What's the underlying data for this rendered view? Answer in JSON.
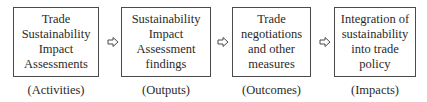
{
  "diagram": {
    "type": "flow",
    "direction": "left-to-right",
    "stages": [
      {
        "text": "Trade\nSustainability\nImpact\nAssessments",
        "label": "(Activities)"
      },
      {
        "text": "Sustainability\nImpact\nAssessment\nfindings",
        "label": "(Outputs)"
      },
      {
        "text": "Trade\nnegotiations\nand other\nmeasures",
        "label": "(Outcomes)"
      },
      {
        "text": "Integration of\nsustainability\ninto trade\npolicy",
        "label": "(Impacts)"
      }
    ],
    "connectors": [
      {
        "from": 0,
        "to": 1,
        "icon": "outlined-right-arrow-icon"
      },
      {
        "from": 1,
        "to": 2,
        "icon": "outlined-right-arrow-icon"
      },
      {
        "from": 2,
        "to": 3,
        "icon": "outlined-right-arrow-icon"
      }
    ],
    "colors": {
      "border": "#4a4a4a",
      "text": "#2a2a2a",
      "background": "#ffffff"
    }
  }
}
